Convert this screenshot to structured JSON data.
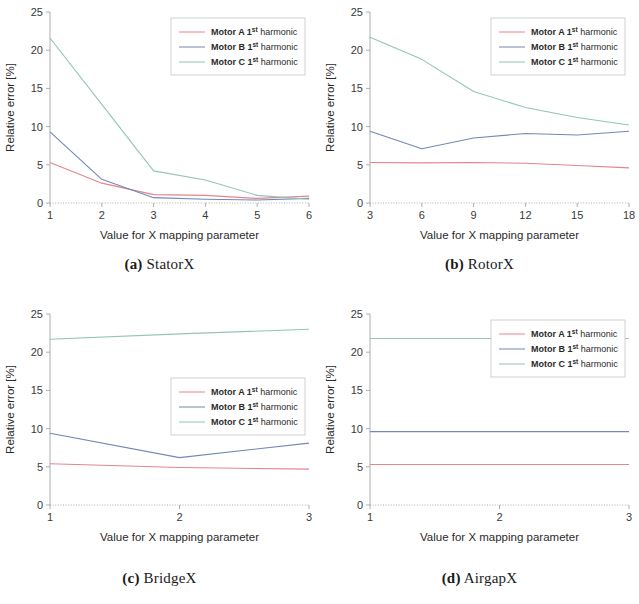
{
  "figure": {
    "background": "#ffffff",
    "axis_color": "#9a9a9a",
    "series_colors": {
      "motor_a": "#e4848c",
      "motor_b": "#7288b8",
      "motor_c": "#93c3ba"
    },
    "legend_labels": {
      "motor_a": "Motor A 1",
      "motor_b": "Motor B 1",
      "motor_c": "Motor C 1",
      "sup": "st",
      "suffix": "harmonic"
    },
    "axis_titles": {
      "x": "Value for X mapping parameter",
      "y": "Relative error [%]"
    },
    "y_ticks": [
      "0",
      "5",
      "10",
      "15",
      "20",
      "25"
    ]
  },
  "chart_data": [
    {
      "id": "a",
      "type": "line",
      "title": "StatorX",
      "caption_letter": "(a)",
      "caption": "(a) StatorX",
      "xlabel": "Value for X mapping parameter",
      "ylabel": "Relative error [%]",
      "xlim": [
        1,
        6
      ],
      "ylim": [
        0,
        25
      ],
      "xticks": [
        1,
        2,
        3,
        4,
        5,
        6
      ],
      "yticks": [
        0,
        5,
        10,
        15,
        20,
        25
      ],
      "grid": false,
      "legend_position": "top-right",
      "x": [
        1,
        2,
        3,
        4,
        5,
        6
      ],
      "series": [
        {
          "name": "Motor A 1st harmonic",
          "color": "#e4848c",
          "values": [
            5.3,
            2.6,
            1.1,
            1.0,
            0.6,
            0.9
          ]
        },
        {
          "name": "Motor B 1st harmonic",
          "color": "#7288b8",
          "values": [
            9.3,
            3.1,
            0.7,
            0.5,
            0.4,
            0.6
          ]
        },
        {
          "name": "Motor C 1st harmonic",
          "color": "#93c3ba",
          "values": [
            21.6,
            12.9,
            4.2,
            3.0,
            1.0,
            0.5
          ]
        }
      ]
    },
    {
      "id": "b",
      "type": "line",
      "title": "RotorX",
      "caption_letter": "(b)",
      "caption": "(b) RotorX",
      "xlabel": "Value for X mapping parameter",
      "ylabel": "Relative error [%]",
      "xlim": [
        3,
        18
      ],
      "ylim": [
        0,
        25
      ],
      "xticks": [
        3,
        6,
        9,
        12,
        15,
        18
      ],
      "yticks": [
        0,
        5,
        10,
        15,
        20,
        25
      ],
      "grid": false,
      "legend_position": "top-right",
      "x": [
        3,
        6,
        9,
        12,
        15,
        18
      ],
      "series": [
        {
          "name": "Motor A 1st harmonic",
          "color": "#e4848c",
          "values": [
            5.3,
            5.25,
            5.3,
            5.2,
            4.9,
            4.6
          ]
        },
        {
          "name": "Motor B 1st harmonic",
          "color": "#7288b8",
          "values": [
            9.4,
            7.1,
            8.5,
            9.1,
            8.9,
            9.4
          ]
        },
        {
          "name": "Motor C 1st harmonic",
          "color": "#93c3ba",
          "values": [
            21.7,
            18.8,
            14.6,
            12.5,
            11.2,
            10.2
          ]
        }
      ]
    },
    {
      "id": "c",
      "type": "line",
      "title": "BridgeX",
      "caption_letter": "(c)",
      "caption": "(c) BridgeX",
      "xlabel": "Value for X mapping parameter",
      "ylabel": "Relative error [%]",
      "xlim": [
        1,
        3
      ],
      "ylim": [
        0,
        25
      ],
      "xticks": [
        1,
        2,
        3
      ],
      "yticks": [
        0,
        5,
        10,
        15,
        20,
        25
      ],
      "grid": false,
      "legend_position": "center-right",
      "x": [
        1,
        2,
        3
      ],
      "series": [
        {
          "name": "Motor A 1st harmonic",
          "color": "#e4848c",
          "values": [
            5.4,
            4.9,
            4.7
          ]
        },
        {
          "name": "Motor B 1st harmonic",
          "color": "#7288b8",
          "values": [
            9.4,
            6.2,
            8.1
          ]
        },
        {
          "name": "Motor C 1st harmonic",
          "color": "#93c3ba",
          "values": [
            21.7,
            22.4,
            23.0
          ]
        }
      ]
    },
    {
      "id": "d",
      "type": "line",
      "title": "AirgapX",
      "caption_letter": "(d)",
      "caption": "(d) AirgapX",
      "xlabel": "Value for X mapping parameter",
      "ylabel": "Relative error [%]",
      "xlim": [
        1,
        3
      ],
      "ylim": [
        0,
        25
      ],
      "xticks": [
        1,
        2,
        3
      ],
      "yticks": [
        0,
        5,
        10,
        15,
        20,
        25
      ],
      "grid": false,
      "legend_position": "top-right",
      "x": [
        1,
        2,
        3
      ],
      "series": [
        {
          "name": "Motor A 1st harmonic",
          "color": "#e4848c",
          "values": [
            5.3,
            5.3,
            5.3
          ]
        },
        {
          "name": "Motor B 1st harmonic",
          "color": "#7288b8",
          "values": [
            9.6,
            9.6,
            9.6
          ]
        },
        {
          "name": "Motor C 1st harmonic",
          "color": "#93c3ba",
          "values": [
            21.8,
            21.8,
            21.8
          ]
        }
      ]
    }
  ]
}
